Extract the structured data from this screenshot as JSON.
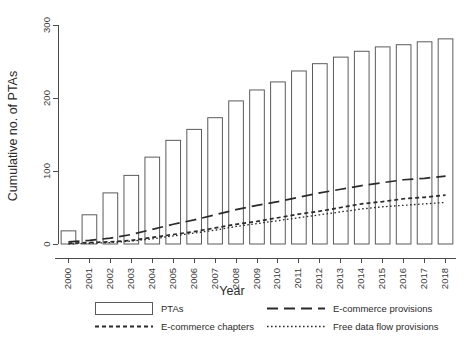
{
  "chart_data": {
    "type": "bar",
    "title": "",
    "subtitle": "",
    "xlabel": "Year",
    "ylabel": "Cumulative no. of PTAs",
    "categories": [
      "2000",
      "2001",
      "2002",
      "2003",
      "2004",
      "2005",
      "2006",
      "2007",
      "2008",
      "2009",
      "2010",
      "2011",
      "2012",
      "2013",
      "2014",
      "2015",
      "2016",
      "2017",
      "2018"
    ],
    "xlim": [
      2000,
      2018
    ],
    "ylim": [
      0,
      300
    ],
    "yticks": [
      0,
      100,
      200,
      300
    ],
    "ytick_labels": [
      "0",
      "100",
      "200",
      "300"
    ],
    "grid": false,
    "legend_position": "bottom",
    "series": [
      {
        "name": "PTAs",
        "render": "bar",
        "values": [
          18,
          40,
          70,
          94,
          119,
          142,
          157,
          173,
          196,
          211,
          222,
          237,
          247,
          256,
          264,
          270,
          273,
          277,
          281
        ]
      },
      {
        "name": "E-commerce provisions",
        "render": "long-dash-line",
        "values": [
          3,
          5,
          8,
          13,
          20,
          27,
          33,
          40,
          47,
          53,
          58,
          64,
          70,
          75,
          80,
          84,
          88,
          90,
          93
        ]
      },
      {
        "name": "E-commerce chapters",
        "render": "dashed-line",
        "values": [
          1,
          2,
          3,
          5,
          9,
          13,
          17,
          22,
          27,
          31,
          36,
          41,
          45,
          50,
          55,
          58,
          62,
          64,
          67
        ]
      },
      {
        "name": "Free data flow provisions",
        "render": "dotted-line",
        "values": [
          0,
          1,
          2,
          4,
          7,
          11,
          15,
          19,
          24,
          28,
          32,
          36,
          40,
          44,
          48,
          51,
          53,
          55,
          57
        ]
      }
    ]
  },
  "legend": {
    "entries": [
      {
        "label": "PTAs",
        "key": "box-key",
        "column": "left",
        "row": 1
      },
      {
        "label": "E-commerce chapters",
        "key": "dashed-line-key",
        "column": "left",
        "row": 2
      },
      {
        "label": "E-commerce provisions",
        "key": "long-dash-line-key",
        "column": "right",
        "row": 1
      },
      {
        "label": "Free data flow provisions",
        "key": "dotted-line-key",
        "column": "right",
        "row": 2
      }
    ]
  },
  "colors": {
    "axis": "#4a4a4a",
    "bar_stroke": "#5b5b5b",
    "bar_fill": "#ffffff",
    "line": "#2a2a2a",
    "background": "#ffffff"
  }
}
